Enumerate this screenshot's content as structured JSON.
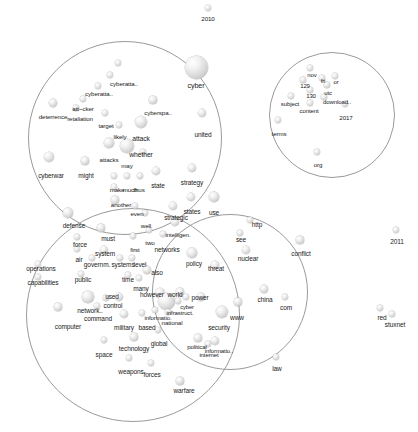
{
  "figure": {
    "type": "network-graph",
    "title": "",
    "background_color": "#ffffff",
    "node_color": "#d8d8d8",
    "circle_color": "#9a9a9a",
    "label_color": "#1a1a1a"
  },
  "chart_data": {
    "type": "scatter",
    "title": "",
    "xlabel": "",
    "ylabel": "",
    "grid": false,
    "legend": false,
    "clusters": [
      {
        "name": "cyber-strategy-cluster",
        "cx": 125,
        "cy": 138,
        "r": 97
      },
      {
        "name": "military-operations-cluster",
        "cx": 133,
        "cy": 315,
        "r": 107
      },
      {
        "name": "cyber-security-cluster",
        "cx": 230,
        "cy": 292,
        "r": 78
      },
      {
        "name": "download-terms-cluster",
        "cx": 332,
        "cy": 115,
        "r": 63
      }
    ],
    "nodes": [
      {
        "label": "2010",
        "x": 208,
        "y": 8,
        "r": 3.2,
        "fs": 6.2,
        "lx": 208,
        "ly": 16
      },
      {
        "label": "cyber",
        "x": 196,
        "y": 67,
        "r": 11.5,
        "fs": 7.2,
        "lx": 196,
        "ly": 82
      },
      {
        "label": "cyberatta..",
        "x": 110,
        "y": 75,
        "r": 3.2,
        "fs": 6.2,
        "lx": 124,
        "ly": 81
      },
      {
        "label": "cyberatta..",
        "x": 98,
        "y": 86,
        "r": 3.0,
        "fs": 6.2,
        "lx": 99,
        "ly": 91
      },
      {
        "label": "",
        "x": 118,
        "y": 63,
        "r": 3.4,
        "fs": 6.2,
        "lx": 118,
        "ly": 63
      },
      {
        "label": "att~cker",
        "x": 83,
        "y": 99,
        "r": 3.4,
        "fs": 6.2,
        "lx": 83,
        "ly": 106
      },
      {
        "label": "deterrence",
        "x": 53,
        "y": 103,
        "r": 3.8,
        "fs": 6.2,
        "lx": 53,
        "ly": 114
      },
      {
        "label": "retaliation",
        "x": 76,
        "y": 108,
        "r": 2.8,
        "fs": 6.2,
        "lx": 80,
        "ly": 116
      },
      {
        "label": "target",
        "x": 105,
        "y": 113,
        "r": 3.4,
        "fs": 6.2,
        "lx": 106,
        "ly": 123
      },
      {
        "label": "cyberspa..",
        "x": 153,
        "y": 100,
        "r": 3.6,
        "fs": 6.2,
        "lx": 158,
        "ly": 110
      },
      {
        "label": "likely",
        "x": 119,
        "y": 125,
        "r": 3.2,
        "fs": 6.2,
        "lx": 120,
        "ly": 134
      },
      {
        "label": "attack",
        "x": 141,
        "y": 122,
        "r": 6.0,
        "fs": 6.8,
        "lx": 141,
        "ly": 136
      },
      {
        "label": "united",
        "x": 202,
        "y": 113,
        "r": 4.2,
        "fs": 6.5,
        "lx": 203,
        "ly": 132
      },
      {
        "label": "whether",
        "x": 127,
        "y": 146,
        "r": 7.0,
        "fs": 6.8,
        "lx": 141,
        "ly": 152
      },
      {
        "label": "attacks",
        "x": 109,
        "y": 143,
        "r": 4.6,
        "fs": 6.2,
        "lx": 109,
        "ly": 157
      },
      {
        "label": "may",
        "x": 143,
        "y": 152,
        "r": 3.0,
        "fs": 6.2,
        "lx": 127,
        "ly": 163
      },
      {
        "label": "cyberwar",
        "x": 49,
        "y": 157,
        "r": 5.4,
        "fs": 6.5,
        "lx": 51,
        "ly": 173
      },
      {
        "label": "might",
        "x": 85,
        "y": 161,
        "r": 3.6,
        "fs": 6.5,
        "lx": 86,
        "ly": 173
      },
      {
        "label": "state",
        "x": 156,
        "y": 171,
        "r": 4.4,
        "fs": 6.5,
        "lx": 158,
        "ly": 183
      },
      {
        "label": "strategy",
        "x": 192,
        "y": 168,
        "r": 4.0,
        "fs": 6.5,
        "lx": 192,
        "ly": 180
      },
      {
        "label": "make",
        "x": 114,
        "y": 176,
        "r": 3.2,
        "fs": 6.2,
        "lx": 117,
        "ly": 187
      },
      {
        "label": "much",
        "x": 127,
        "y": 176,
        "r": 3.2,
        "fs": 6.2,
        "lx": 130,
        "ly": 187
      },
      {
        "label": "thus",
        "x": 140,
        "y": 176,
        "r": 3.2,
        "fs": 6.2,
        "lx": 139,
        "ly": 187
      },
      {
        "label": "",
        "x": 114,
        "y": 187,
        "r": 3.4,
        "fs": 6.2,
        "lx": 114,
        "ly": 187
      },
      {
        "label": "another",
        "x": 115,
        "y": 200,
        "r": 3.6,
        "fs": 6.2,
        "lx": 121,
        "ly": 202
      },
      {
        "label": "even",
        "x": 135,
        "y": 206,
        "r": 3.0,
        "fs": 6.2,
        "lx": 137,
        "ly": 211
      },
      {
        "label": "strategic",
        "x": 173,
        "y": 206,
        "r": 4.0,
        "fs": 6.5,
        "lx": 176,
        "ly": 215
      },
      {
        "label": "states",
        "x": 191,
        "y": 197,
        "r": 4.4,
        "fs": 6.5,
        "lx": 192,
        "ly": 209
      },
      {
        "label": "use",
        "x": 214,
        "y": 197,
        "r": 4.6,
        "fs": 6.5,
        "lx": 214,
        "ly": 210
      },
      {
        "label": "well",
        "x": 145,
        "y": 213,
        "r": 3.2,
        "fs": 6.2,
        "lx": 146,
        "ly": 223
      },
      {
        "label": "defense",
        "x": 68,
        "y": 213,
        "r": 4.6,
        "fs": 6.5,
        "lx": 74,
        "ly": 223
      },
      {
        "label": "intelligen.",
        "x": 175,
        "y": 222,
        "r": 4.0,
        "fs": 6.2,
        "lx": 178,
        "ly": 232
      },
      {
        "label": "must",
        "x": 101,
        "y": 228,
        "r": 3.6,
        "fs": 6.5,
        "lx": 108,
        "ly": 236
      },
      {
        "label": "two",
        "x": 149,
        "y": 230,
        "r": 3.2,
        "fs": 6.2,
        "lx": 150,
        "ly": 240
      },
      {
        "label": "first",
        "x": 133,
        "y": 236,
        "r": 3.0,
        "fs": 6.2,
        "lx": 135,
        "ly": 247
      },
      {
        "label": "networks",
        "x": 163,
        "y": 234,
        "r": 3.4,
        "fs": 6.5,
        "lx": 167,
        "ly": 247
      },
      {
        "label": "force",
        "x": 77,
        "y": 237,
        "r": 3.2,
        "fs": 6.5,
        "lx": 80,
        "ly": 242
      },
      {
        "label": "air",
        "x": 77,
        "y": 249,
        "r": 3.0,
        "fs": 6.5,
        "lx": 79,
        "ly": 257
      },
      {
        "label": "system",
        "x": 104,
        "y": 250,
        "r": 4.2,
        "fs": 6.5,
        "lx": 105,
        "ly": 251
      },
      {
        "label": "governm.",
        "x": 92,
        "y": 258,
        "r": 3.0,
        "fs": 6.5,
        "lx": 97,
        "ly": 262
      },
      {
        "label": "systems",
        "x": 120,
        "y": 258,
        "r": 3.0,
        "fs": 6.5,
        "lx": 123,
        "ly": 262
      },
      {
        "label": "level",
        "x": 132,
        "y": 258,
        "r": 3.4,
        "fs": 6.5,
        "lx": 140,
        "ly": 262
      },
      {
        "label": "policy",
        "x": 192,
        "y": 253,
        "r": 4.6,
        "fs": 6.5,
        "lx": 194,
        "ly": 261
      },
      {
        "label": "threat",
        "x": 215,
        "y": 265,
        "r": 3.8,
        "fs": 6.5,
        "lx": 216,
        "ly": 266
      },
      {
        "label": "operations",
        "x": 38,
        "y": 264,
        "r": 3.4,
        "fs": 6.5,
        "lx": 41,
        "ly": 266
      },
      {
        "label": "also",
        "x": 147,
        "y": 270,
        "r": 3.8,
        "fs": 6.5,
        "lx": 157,
        "ly": 270
      },
      {
        "label": "time",
        "x": 128,
        "y": 275,
        "r": 3.0,
        "fs": 6.5,
        "lx": 128,
        "ly": 277
      },
      {
        "label": "many",
        "x": 139,
        "y": 278,
        "r": 3.0,
        "fs": 6.5,
        "lx": 141,
        "ly": 286
      },
      {
        "label": "public",
        "x": 81,
        "y": 274,
        "r": 3.0,
        "fs": 6.5,
        "lx": 83,
        "ly": 277
      },
      {
        "label": "capabilities",
        "x": 38,
        "y": 277,
        "r": 3.0,
        "fs": 6.5,
        "lx": 43,
        "ly": 280
      },
      {
        "label": "however",
        "x": 160,
        "y": 293,
        "r": 5.4,
        "fs": 6.5,
        "lx": 152,
        "ly": 292
      },
      {
        "label": "world",
        "x": 180,
        "y": 292,
        "r": 3.6,
        "fs": 6.5,
        "lx": 175,
        "ly": 292
      },
      {
        "label": "used",
        "x": 119,
        "y": 297,
        "r": 4.0,
        "fs": 6.5,
        "lx": 112,
        "ly": 294
      },
      {
        "label": "network..",
        "x": 88,
        "y": 297,
        "r": 5.6,
        "fs": 6.5,
        "lx": 90,
        "ly": 308
      },
      {
        "label": "control",
        "x": 106,
        "y": 298,
        "r": 3.2,
        "fs": 6.5,
        "lx": 113,
        "ly": 303
      },
      {
        "label": "",
        "x": 166,
        "y": 301,
        "r": 8.5,
        "fs": 6.5,
        "lx": 166,
        "ly": 301
      },
      {
        "label": "infrastruct.",
        "x": 178,
        "y": 301,
        "r": 3.2,
        "fs": 6.0,
        "lx": 180,
        "ly": 310
      },
      {
        "label": "cyber",
        "x": 186,
        "y": 297,
        "r": 3.0,
        "fs": 5.8,
        "lx": 187,
        "ly": 305
      },
      {
        "label": "power",
        "x": 201,
        "y": 297,
        "r": 3.8,
        "fs": 6.5,
        "lx": 200,
        "ly": 295
      },
      {
        "label": "command",
        "x": 97,
        "y": 306,
        "r": 3.2,
        "fs": 6.5,
        "lx": 98,
        "ly": 316
      },
      {
        "label": "computer",
        "x": 58,
        "y": 307,
        "r": 3.6,
        "fs": 6.5,
        "lx": 68,
        "ly": 324
      },
      {
        "label": "national",
        "x": 168,
        "y": 312,
        "r": 3.4,
        "fs": 6.2,
        "lx": 172,
        "ly": 320
      },
      {
        "label": "informatio.",
        "x": 155,
        "y": 310,
        "r": 3.2,
        "fs": 6.0,
        "lx": 158,
        "ly": 315
      },
      {
        "label": "military",
        "x": 124,
        "y": 314,
        "r": 4.2,
        "fs": 6.5,
        "lx": 124,
        "ly": 325
      },
      {
        "label": "based",
        "x": 142,
        "y": 313,
        "r": 3.4,
        "fs": 6.5,
        "lx": 147,
        "ly": 325
      },
      {
        "label": "security",
        "x": 222,
        "y": 312,
        "r": 6.0,
        "fs": 6.5,
        "lx": 219,
        "ly": 325
      },
      {
        "label": "www",
        "x": 238,
        "y": 302,
        "r": 3.6,
        "fs": 6.5,
        "lx": 237,
        "ly": 315
      },
      {
        "label": "global",
        "x": 158,
        "y": 330,
        "r": 3.2,
        "fs": 6.5,
        "lx": 159,
        "ly": 341
      },
      {
        "label": "technology",
        "x": 134,
        "y": 337,
        "r": 3.6,
        "fs": 6.5,
        "lx": 134,
        "ly": 346
      },
      {
        "label": "space",
        "x": 104,
        "y": 340,
        "r": 3.2,
        "fs": 6.5,
        "lx": 104,
        "ly": 352
      },
      {
        "label": "political",
        "x": 198,
        "y": 338,
        "r": 3.6,
        "fs": 6.2,
        "lx": 197,
        "ly": 344
      },
      {
        "label": "informatio..",
        "x": 215,
        "y": 341,
        "r": 4.4,
        "fs": 6.0,
        "lx": 219,
        "ly": 348
      },
      {
        "label": "internet",
        "x": 208,
        "y": 344,
        "r": 3.4,
        "fs": 6.0,
        "lx": 209,
        "ly": 352
      },
      {
        "label": "weapons",
        "x": 129,
        "y": 358,
        "r": 3.4,
        "fs": 6.5,
        "lx": 131,
        "ly": 369
      },
      {
        "label": "forces",
        "x": 151,
        "y": 363,
        "r": 3.2,
        "fs": 6.5,
        "lx": 152,
        "ly": 372
      },
      {
        "label": "warfare",
        "x": 180,
        "y": 381,
        "r": 3.6,
        "fs": 6.5,
        "lx": 184,
        "ly": 388
      },
      {
        "label": "http",
        "x": 250,
        "y": 220,
        "r": 3.4,
        "fs": 6.5,
        "lx": 257,
        "ly": 222
      },
      {
        "label": "see",
        "x": 240,
        "y": 233,
        "r": 3.4,
        "fs": 6.5,
        "lx": 241,
        "ly": 237
      },
      {
        "label": "nuclear",
        "x": 246,
        "y": 250,
        "r": 4.2,
        "fs": 6.5,
        "lx": 248,
        "ly": 256
      },
      {
        "label": "conflict",
        "x": 300,
        "y": 240,
        "r": 3.6,
        "fs": 6.5,
        "lx": 301,
        "ly": 251
      },
      {
        "label": "2011",
        "x": 396,
        "y": 230,
        "r": 3.2,
        "fs": 6.5,
        "lx": 397,
        "ly": 239
      },
      {
        "label": "china",
        "x": 264,
        "y": 289,
        "r": 3.8,
        "fs": 6.5,
        "lx": 265,
        "ly": 297
      },
      {
        "label": "com",
        "x": 285,
        "y": 297,
        "r": 3.0,
        "fs": 6.5,
        "lx": 286,
        "ly": 305
      },
      {
        "label": "red",
        "x": 380,
        "y": 308,
        "r": 3.0,
        "fs": 6.5,
        "lx": 382,
        "ly": 315
      },
      {
        "label": "stuxnet",
        "x": 392,
        "y": 314,
        "r": 2.8,
        "fs": 6.5,
        "lx": 395,
        "ly": 322
      },
      {
        "label": "law",
        "x": 276,
        "y": 357,
        "r": 3.4,
        "fs": 6.5,
        "lx": 277,
        "ly": 366
      },
      {
        "label": "nov",
        "x": 310,
        "y": 68,
        "r": 3.0,
        "fs": 6.0,
        "lx": 312,
        "ly": 72
      },
      {
        "label": "fri",
        "x": 322,
        "y": 78,
        "r": 3.0,
        "fs": 6.0,
        "lx": 323,
        "ly": 78
      },
      {
        "label": "or",
        "x": 335,
        "y": 76,
        "r": 3.0,
        "fs": 6.0,
        "lx": 336,
        "ly": 79
      },
      {
        "label": "129",
        "x": 303,
        "y": 80,
        "r": 2.8,
        "fs": 6.0,
        "lx": 305,
        "ly": 83
      },
      {
        "label": "utc",
        "x": 327,
        "y": 85,
        "r": 2.8,
        "fs": 6.0,
        "lx": 328,
        "ly": 90
      },
      {
        "label": "130",
        "x": 310,
        "y": 90,
        "r": 2.8,
        "fs": 6.0,
        "lx": 311,
        "ly": 93
      },
      {
        "label": "download..",
        "x": 324,
        "y": 97,
        "r": 2.8,
        "fs": 6.0,
        "lx": 337,
        "ly": 99
      },
      {
        "label": "subject",
        "x": 291,
        "y": 96,
        "r": 3.2,
        "fs": 6.0,
        "lx": 290,
        "ly": 101
      },
      {
        "label": "content",
        "x": 310,
        "y": 103,
        "r": 3.0,
        "fs": 6.0,
        "lx": 309,
        "ly": 108
      },
      {
        "label": "2017",
        "x": 345,
        "y": 104,
        "r": 3.0,
        "fs": 6.2,
        "lx": 346,
        "ly": 115
      },
      {
        "label": "terms",
        "x": 278,
        "y": 120,
        "r": 3.4,
        "fs": 6.2,
        "lx": 279,
        "ly": 131
      },
      {
        "label": "org",
        "x": 317,
        "y": 152,
        "r": 3.2,
        "fs": 6.2,
        "lx": 318,
        "ly": 162
      }
    ]
  }
}
